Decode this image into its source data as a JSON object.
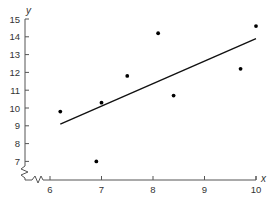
{
  "chart_data": {
    "type": "scatter",
    "title": "",
    "xlabel": "x",
    "ylabel": "y",
    "xlim": [
      5.5,
      10
    ],
    "ylim": [
      6.2,
      15
    ],
    "x_ticks": [
      6,
      7,
      8,
      9,
      10
    ],
    "y_ticks": [
      7,
      8,
      9,
      10,
      11,
      12,
      13,
      14,
      15
    ],
    "grid": false,
    "legend": null,
    "axis_break": true,
    "series": [
      {
        "name": "data points",
        "type": "scatter",
        "points": [
          {
            "x": 6.2,
            "y": 9.8
          },
          {
            "x": 6.9,
            "y": 7.0
          },
          {
            "x": 7.0,
            "y": 10.3
          },
          {
            "x": 7.5,
            "y": 11.8
          },
          {
            "x": 8.1,
            "y": 14.2
          },
          {
            "x": 8.4,
            "y": 10.7
          },
          {
            "x": 9.7,
            "y": 12.2
          },
          {
            "x": 10.0,
            "y": 14.6
          }
        ]
      },
      {
        "name": "regression line",
        "type": "line",
        "points": [
          {
            "x": 6.2,
            "y": 9.1
          },
          {
            "x": 10.0,
            "y": 13.9
          }
        ]
      }
    ]
  },
  "labels": {
    "x_axis": "x",
    "y_axis": "y",
    "x_ticks": [
      "6",
      "7",
      "8",
      "9",
      "10"
    ],
    "y_ticks": [
      "7",
      "8",
      "9",
      "10",
      "11",
      "12",
      "13",
      "14",
      "15"
    ]
  }
}
